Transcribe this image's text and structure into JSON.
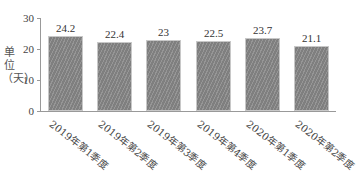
{
  "chart_data": {
    "type": "bar",
    "title": "",
    "xlabel": "",
    "ylabel": "单位（天）",
    "ylim": [
      0,
      30
    ],
    "yticks": [
      0,
      10,
      20,
      30
    ],
    "grid": false,
    "legend": null,
    "categories": [
      "2019年第1季度",
      "2019年第2季度",
      "2019年第3季度",
      "2019年第4季度",
      "2020年第1季度",
      "2020年第2季度"
    ],
    "values": [
      24.2,
      22.4,
      23,
      22.5,
      23.7,
      21.1
    ],
    "value_labels": [
      "24.2",
      "22.4",
      "23",
      "22.5",
      "23.7",
      "21.1"
    ],
    "bar_color": "#7f7f7f"
  },
  "axis": {
    "ylabel": "单位（天）",
    "ticks": [
      "30",
      "20",
      "10",
      "0"
    ]
  }
}
